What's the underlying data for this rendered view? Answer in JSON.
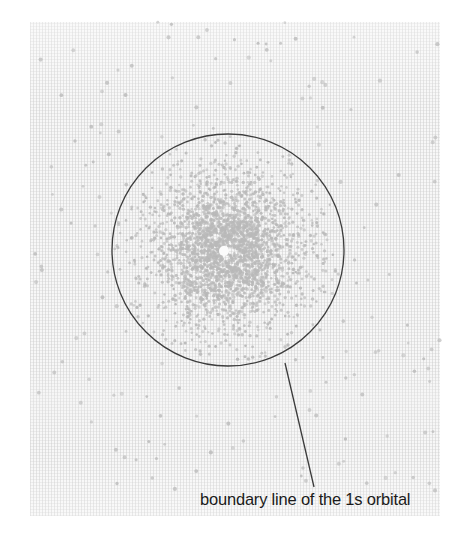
{
  "figure": {
    "width": 461,
    "height": 537,
    "background_color": "#ffffff",
    "paper_color": "#f7f7f7"
  },
  "annotation": {
    "caption": "boundary line of the 1s orbital",
    "text_color": "#1b1b1b",
    "leader_line": {
      "start_x": 285,
      "start_y": 363,
      "end_x": 314,
      "end_y": 487,
      "color": "#3a3a3a",
      "width": 1.3
    }
  },
  "chart_data": {
    "type": "scatter",
    "title": "",
    "subtitle": "",
    "xlabel": "",
    "ylabel": "",
    "legend": [],
    "grid": false,
    "boundary_circle": {
      "label": "boundary line of the 1s orbital",
      "center_x": 228,
      "center_y": 250,
      "radius": 116,
      "stroke_color": "#3c3c3c",
      "stroke_width": 1.3,
      "fill": "none"
    },
    "nucleus": {
      "center_x": 224,
      "center_y": 251,
      "radius": 5,
      "color": "#fbfbfb"
    },
    "dot_cloud": {
      "dot_color": "#b9b9b9",
      "dot_radius_inner": 1.45,
      "dot_radius_outer": 1.7,
      "density_profile": "exponential decay, |psi|^2 proportional to exp(-2r/a0)",
      "inner_dot_count": 2600,
      "outer_dot_count": 150,
      "radial_falloff_a0": 34,
      "spiral_arrangement": true,
      "golden_angle_deg": 137.508
    },
    "axis_ranges": {
      "xlim": [
        30,
        440
      ],
      "ylim": [
        22,
        516
      ]
    }
  }
}
